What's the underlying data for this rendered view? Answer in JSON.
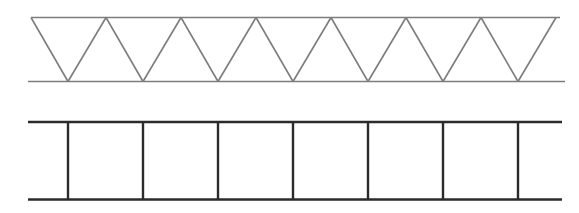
{
  "figure": {
    "background_color": "#ffffff",
    "width": 579,
    "height": 213
  },
  "diagrams": [
    {
      "id": "warren-truss",
      "name": "Warren truss",
      "description": "Triangulated truss with alternating diagonal web members forming a continuous zig-zag between top and bottom chords",
      "line_color": "#7d7d7d",
      "line_width": 1.6,
      "geometry": {
        "top_chord": {
          "x1": 31,
          "y1": 17.5,
          "x2": 560,
          "y2": 17.5
        },
        "bottom_chord": {
          "x1": 28,
          "y1": 81.5,
          "x2": 565,
          "y2": 81.5
        },
        "top_nodes_x": [
          31,
          106,
          181,
          256,
          331,
          406,
          481,
          556
        ],
        "bottom_nodes_x": [
          68,
          143,
          218,
          293,
          368,
          443,
          518
        ],
        "panel_count": 7,
        "panel_spacing": 75,
        "depth": 64
      }
    },
    {
      "id": "vierendeel-truss",
      "name": "Vierendeel truss",
      "description": "Rectangular ladder frame with vertical posts and no diagonal web members",
      "line_color": "#2b2b2b",
      "line_width": 2.4,
      "geometry": {
        "top_chord": {
          "x1": 28,
          "y1": 122,
          "x2": 562,
          "y2": 122
        },
        "bottom_chord": {
          "x1": 28,
          "y1": 199.5,
          "x2": 562,
          "y2": 199.5
        },
        "post_nodes_x": [
          68,
          143,
          218,
          293,
          368,
          443,
          518
        ],
        "bay_count": 6,
        "post_spacing": 75,
        "depth": 77.5
      }
    }
  ]
}
